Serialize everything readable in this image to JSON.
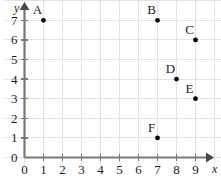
{
  "chart_data": {
    "type": "scatter",
    "title": "",
    "xlabel": "x",
    "ylabel": "y",
    "xlim": [
      0,
      9
    ],
    "ylim": [
      0,
      7
    ],
    "grid": true,
    "legend": "none",
    "x_ticks": [
      "0",
      "1",
      "2",
      "3",
      "4",
      "5",
      "6",
      "7",
      "8",
      "9"
    ],
    "y_ticks": [
      "0",
      "1",
      "2",
      "3",
      "4",
      "5",
      "6",
      "7"
    ],
    "points": [
      {
        "label": "A",
        "x": 1,
        "y": 7
      },
      {
        "label": "B",
        "x": 7,
        "y": 7
      },
      {
        "label": "C",
        "x": 9,
        "y": 6
      },
      {
        "label": "D",
        "x": 8,
        "y": 4
      },
      {
        "label": "E",
        "x": 9,
        "y": 3
      },
      {
        "label": "F",
        "x": 7,
        "y": 1
      }
    ]
  },
  "style": {
    "background": "#ffffff",
    "grid_color": "#e3e3e3",
    "axis_color": "#787878",
    "point_color": "#000000",
    "text_color": "#1a1a1a"
  }
}
